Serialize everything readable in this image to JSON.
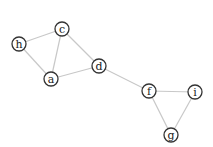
{
  "diagram": {
    "type": "undirected-graph",
    "style": {
      "edge_color": "#c8c8c8",
      "node_stroke": "#333333",
      "node_fill": "#ffffff",
      "label_color": "#222222",
      "node_radius": 7
    },
    "nodes": [
      {
        "id": "h",
        "label": "h",
        "x": 19,
        "y": 44
      },
      {
        "id": "c",
        "label": "c",
        "x": 62,
        "y": 29
      },
      {
        "id": "a",
        "label": "a",
        "x": 51,
        "y": 79
      },
      {
        "id": "d",
        "label": "d",
        "x": 99,
        "y": 66
      },
      {
        "id": "f",
        "label": "f",
        "x": 149,
        "y": 91
      },
      {
        "id": "i",
        "label": "i",
        "x": 195,
        "y": 92
      },
      {
        "id": "g",
        "label": "g",
        "x": 171,
        "y": 135
      }
    ],
    "edges": [
      {
        "source": "h",
        "target": "c"
      },
      {
        "source": "h",
        "target": "a"
      },
      {
        "source": "c",
        "target": "a"
      },
      {
        "source": "c",
        "target": "d"
      },
      {
        "source": "a",
        "target": "d"
      },
      {
        "source": "d",
        "target": "f"
      },
      {
        "source": "f",
        "target": "i"
      },
      {
        "source": "f",
        "target": "g"
      },
      {
        "source": "i",
        "target": "g"
      }
    ]
  }
}
